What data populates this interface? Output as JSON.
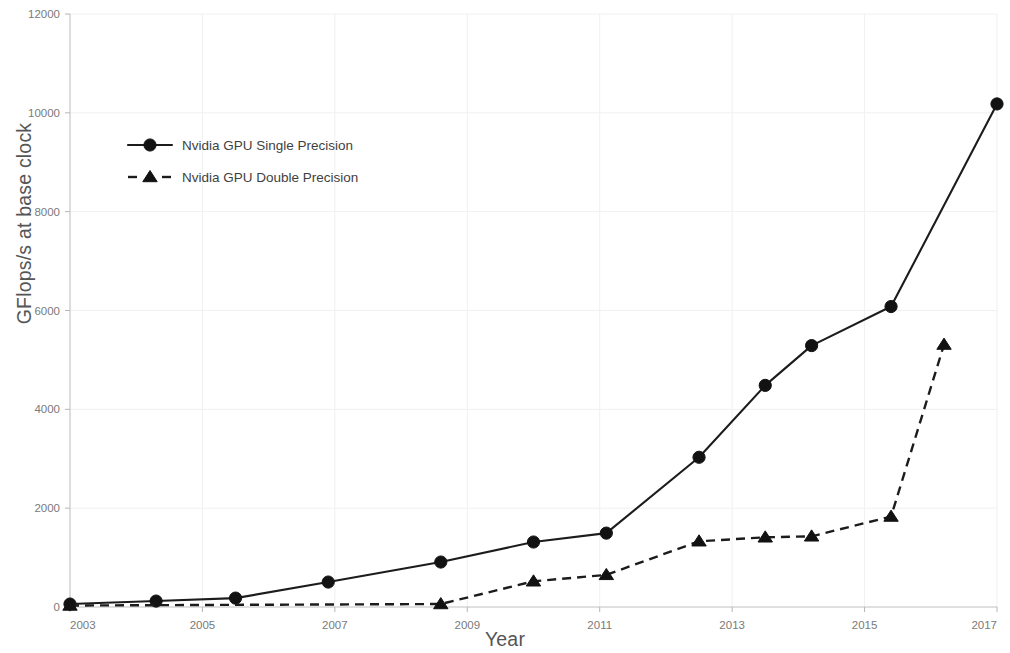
{
  "chart_data": {
    "type": "line",
    "title": "",
    "xlabel": "Year",
    "ylabel": "GFlops/s at base clock",
    "xlim": [
      2003,
      2017
    ],
    "ylim": [
      0,
      12000
    ],
    "xticks": [
      2003,
      2005,
      2007,
      2009,
      2011,
      2013,
      2015,
      2017
    ],
    "xtick_labels": [
      "2003",
      "2005",
      "2007",
      "2009",
      "2011",
      "2013",
      "2015",
      "2017"
    ],
    "yticks": [
      0,
      2000,
      4000,
      6000,
      8000,
      10000,
      12000
    ],
    "ytick_labels": [
      "0",
      "2000",
      "4000",
      "6000",
      "8000",
      "10000",
      "12000"
    ],
    "grid": true,
    "legend_position": "upper left",
    "series": [
      {
        "name": "Nvidia GPU Single Precision",
        "marker": "circle",
        "linestyle": "solid",
        "color": "#121212",
        "x": [
          2003.0,
          2004.3,
          2005.5,
          2006.9,
          2008.6,
          2010.0,
          2011.1,
          2012.5,
          2013.5,
          2014.2,
          2015.4,
          2017.0
        ],
        "values": [
          60,
          120,
          180,
          505,
          910,
          1315,
          1495,
          3030,
          4485,
          5290,
          6080,
          10180
        ]
      },
      {
        "name": "Nvidia GPU Double Precision",
        "marker": "triangle",
        "linestyle": "dashed",
        "color": "#121212",
        "x": [
          2003.0,
          2008.6,
          2010.0,
          2011.1,
          2012.5,
          2013.5,
          2014.2,
          2015.4,
          2016.2
        ],
        "values": [
          30,
          60,
          520,
          650,
          1330,
          1410,
          1430,
          1830,
          5310
        ]
      }
    ]
  },
  "legend": {
    "entries": [
      {
        "label": "Nvidia GPU Single Precision",
        "marker": "circle",
        "linestyle": "solid"
      },
      {
        "label": "Nvidia GPU Double Precision",
        "marker": "triangle",
        "linestyle": "dashed"
      }
    ]
  },
  "axes": {
    "x_title": "Year",
    "y_title": "GFlops/s at base clock"
  }
}
